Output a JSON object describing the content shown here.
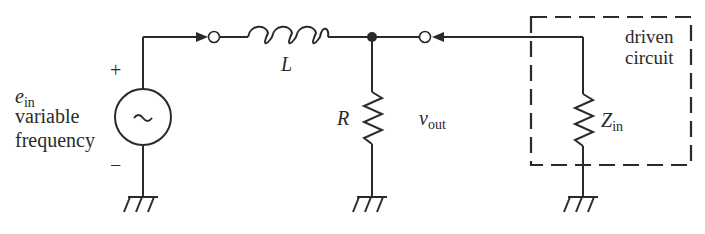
{
  "diagram": {
    "type": "circuit-schematic",
    "colors": {
      "ink": "#2a2a2a",
      "background": "#ffffff"
    },
    "source": {
      "symbol": "~",
      "label_main": "e",
      "label_sub": "in",
      "description_line1": "variable",
      "description_line2": "frequency",
      "plus": "+",
      "minus": "−"
    },
    "inductor": {
      "label": "L"
    },
    "resistor": {
      "label": "R"
    },
    "output": {
      "label_main": "v",
      "label_sub": "out"
    },
    "load": {
      "label_main": "Z",
      "label_sub": "in",
      "box_label_line1": "driven",
      "box_label_line2": "circuit"
    }
  }
}
